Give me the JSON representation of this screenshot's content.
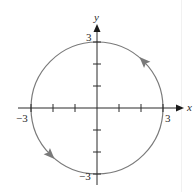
{
  "diagram": {
    "axes": {
      "x_label": "x",
      "y_label": "y",
      "x_range": [
        -3,
        3
      ],
      "y_range": [
        -3,
        3
      ],
      "tick_step": 1
    },
    "tick_labels": {
      "x_neg": "−3",
      "x_pos": "3",
      "y_pos": "3",
      "y_neg": "−3"
    },
    "curve": {
      "type": "circle",
      "center": [
        0,
        0
      ],
      "radius": 3,
      "orientation": "counterclockwise",
      "stroke_color": "#7a7a7a",
      "arrow_color": "#7a7a7a",
      "arrows": [
        {
          "angle_deg": 45,
          "direction": "up-left"
        },
        {
          "angle_deg": 225,
          "direction": "down-right"
        }
      ]
    },
    "axis_color": "#2a2a2a"
  }
}
